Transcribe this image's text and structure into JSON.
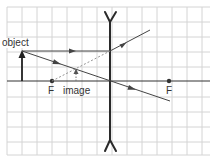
{
  "diagram": {
    "type": "ray-diagram",
    "labels": {
      "object": "object",
      "image": "image",
      "focal_left": "F",
      "focal_right": "F"
    },
    "grid": {
      "spacing_px": 15,
      "origin_x": 7,
      "origin_y": 7,
      "line_color": "#d0d0d0"
    },
    "colors": {
      "axis": "#333333",
      "lens": "#2a2a2a",
      "ray": "#444444",
      "virtual_ray": "#888888",
      "background": "#ffffff"
    },
    "geometry": {
      "lens_x": 110,
      "axis_y": 81,
      "object": {
        "x": 22,
        "y_base": 81,
        "y_tip": 51
      },
      "image": {
        "x": 76,
        "y_base": 81,
        "y_tip": 70
      },
      "focal_points": [
        {
          "x": 52,
          "y": 81
        },
        {
          "x": 169,
          "y": 81
        }
      ]
    }
  }
}
